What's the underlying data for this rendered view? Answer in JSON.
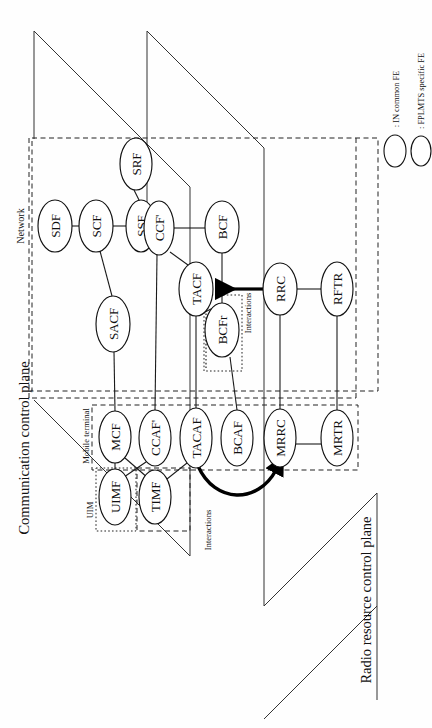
{
  "figure": {
    "orientation": "rotated-90-ccw"
  },
  "planes": [
    {
      "id": "network",
      "label": "Network"
    },
    {
      "id": "communication-control-plane",
      "label": "Communication control plane"
    },
    {
      "id": "radio-resource-control-plane",
      "label": "Radio resource control plane"
    }
  ],
  "groups": [
    {
      "id": "mobile-terminal",
      "label": "Mobile terminal"
    },
    {
      "id": "uim",
      "label": "UIM"
    }
  ],
  "annotations": [
    {
      "id": "interactions-upper",
      "label": "Interactions"
    },
    {
      "id": "interactions-lower",
      "label": "Interactions"
    }
  ],
  "legend": {
    "items": [
      {
        "id": "in-common-fe",
        "label": ": IN common FE",
        "shape": "ellipse"
      },
      {
        "id": "fplmts-specific-fe",
        "label": ": FPLMTS specific FE",
        "shape": "ellipse"
      }
    ]
  },
  "nodes": [
    {
      "id": "SDF",
      "label": "SDF",
      "cx": 55,
      "cy": 226,
      "rx": 17,
      "ry": 26
    },
    {
      "id": "SCF",
      "label": "SCF",
      "cx": 96,
      "cy": 226,
      "rx": 17,
      "ry": 26
    },
    {
      "id": "SSF",
      "label": "SSF",
      "cx": 141,
      "cy": 226,
      "rx": 15,
      "ry": 26
    },
    {
      "id": "CCFp",
      "label": "CCF'",
      "cx": 159,
      "cy": 228,
      "rx": 15,
      "ry": 27
    },
    {
      "id": "SRF",
      "label": "SRF",
      "cx": 136,
      "cy": 164,
      "rx": 16,
      "ry": 26
    },
    {
      "id": "BCF",
      "label": "BCF",
      "cx": 222,
      "cy": 227,
      "rx": 17,
      "ry": 26
    },
    {
      "id": "SACF",
      "label": "SACF",
      "cx": 113,
      "cy": 324,
      "rx": 17,
      "ry": 28
    },
    {
      "id": "TACF",
      "label": "TACF",
      "cx": 196,
      "cy": 289,
      "rx": 17,
      "ry": 27
    },
    {
      "id": "BCFr",
      "label": "BCFr",
      "cx": 222,
      "cy": 330,
      "rx": 17,
      "ry": 27
    },
    {
      "id": "RRC",
      "label": "RRC",
      "cx": 280,
      "cy": 289,
      "rx": 17,
      "ry": 26
    },
    {
      "id": "RFTR",
      "label": "RFTR",
      "cx": 337,
      "cy": 289,
      "rx": 16,
      "ry": 27
    },
    {
      "id": "MCF",
      "label": "MCF",
      "cx": 115,
      "cy": 437,
      "rx": 16,
      "ry": 26
    },
    {
      "id": "CCAF",
      "label": "CCAF'",
      "cx": 155,
      "cy": 438,
      "rx": 16,
      "ry": 28
    },
    {
      "id": "TACAF",
      "label": "TACAF",
      "cx": 196,
      "cy": 438,
      "rx": 16,
      "ry": 30
    },
    {
      "id": "BCAF",
      "label": "BCAF",
      "cx": 237,
      "cy": 438,
      "rx": 16,
      "ry": 28
    },
    {
      "id": "MRRC",
      "label": "MRRC",
      "cx": 280,
      "cy": 438,
      "rx": 16,
      "ry": 29
    },
    {
      "id": "MRTR",
      "label": "MRTR",
      "cx": 337,
      "cy": 438,
      "rx": 16,
      "ry": 28
    },
    {
      "id": "UIMF",
      "label": "UIMF",
      "cx": 115,
      "cy": 497,
      "rx": 16,
      "ry": 28
    },
    {
      "id": "TIMF",
      "label": "TIMF",
      "cx": 155,
      "cy": 497,
      "rx": 16,
      "ry": 27
    }
  ],
  "edges": [
    {
      "from": "SDF",
      "to": "SCF"
    },
    {
      "from": "SCF",
      "to": "SSF"
    },
    {
      "from": "SCF",
      "to": "SACF"
    },
    {
      "from": "SSF",
      "to": "SRF"
    },
    {
      "from": "CCFp",
      "to": "BCF"
    },
    {
      "from": "CCFp",
      "to": "TACF"
    },
    {
      "from": "BCF",
      "to": "BCFr"
    },
    {
      "from": "TACF",
      "to": "BCFr"
    },
    {
      "from": "RRC",
      "to": "RFTR"
    },
    {
      "from": "MCF",
      "to": "UIMF"
    },
    {
      "from": "MCF",
      "to": "TIMF"
    },
    {
      "from": "CCAF",
      "to": "UIMF"
    },
    {
      "from": "TACAF",
      "to": "TIMF"
    },
    {
      "from": "MRRC",
      "to": "MRTR"
    },
    {
      "from": "SACF",
      "to": "MCF"
    },
    {
      "from": "CCFp",
      "to": "CCAF"
    },
    {
      "from": "TACF",
      "to": "TACAF"
    },
    {
      "from": "BCFr",
      "to": "BCAF"
    },
    {
      "from": "RRC",
      "to": "MRRC"
    },
    {
      "from": "RFTR",
      "to": "MRTR"
    }
  ]
}
